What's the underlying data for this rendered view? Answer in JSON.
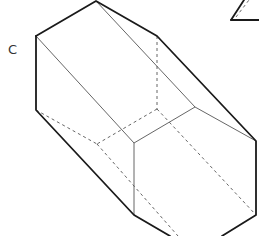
{
  "diagram": {
    "title": "",
    "type": "3d-solid-hexagonal-prism",
    "labels": [
      {
        "id": "vertex-C",
        "text": "C",
        "x": 8,
        "y": 54
      }
    ],
    "colors": {
      "edge": "#1a1a1a",
      "thin_edge": "#555555",
      "hidden_edge": "#555555",
      "background": "#ffffff"
    },
    "edges": {
      "outline": [
        [
          36,
          36,
          96,
          1
        ],
        [
          96,
          1,
          157,
          36
        ],
        [
          157,
          36,
          256,
          141
        ],
        [
          256,
          141,
          256,
          215
        ],
        [
          256,
          215,
          222,
          236
        ],
        [
          36,
          36,
          36,
          110
        ],
        [
          36,
          110,
          134,
          215
        ],
        [
          134,
          215,
          170,
          236
        ]
      ],
      "visible_inner": [
        [
          36,
          36,
          134,
          143
        ],
        [
          96,
          1,
          195,
          107
        ],
        [
          134,
          143,
          195,
          107
        ],
        [
          195,
          107,
          256,
          141
        ],
        [
          134,
          143,
          134,
          215
        ]
      ],
      "hidden": [
        [
          157,
          36,
          157,
          109
        ],
        [
          157,
          109,
          97,
          144
        ],
        [
          36,
          110,
          97,
          144
        ],
        [
          157,
          109,
          256,
          215
        ],
        [
          97,
          144,
          178,
          236
        ]
      ]
    },
    "fragment": {
      "solid": [
        [
          231,
          20,
          244,
          0
        ],
        [
          231,
          20,
          259,
          20
        ]
      ],
      "dashed": [
        [
          236,
          17,
          249,
          0
        ]
      ]
    }
  }
}
